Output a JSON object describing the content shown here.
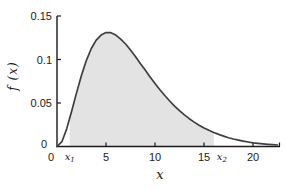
{
  "chart_data": {
    "type": "area",
    "title": "",
    "xlabel": "x",
    "ylabel": "f (x)",
    "xlim": [
      0,
      22.5
    ],
    "ylim": [
      0,
      0.15
    ],
    "x_ticks": [
      0,
      5,
      10,
      15,
      20
    ],
    "x_tick_labels": [
      "0",
      "5",
      "10",
      "15",
      "20"
    ],
    "y_ticks": [
      0,
      0.05,
      0.1,
      0.15
    ],
    "y_tick_labels": [
      "0",
      "0.05",
      "0.1",
      "0.15"
    ],
    "grid": false,
    "legend": null,
    "peak": {
      "x": 5.1,
      "f": 0.131
    },
    "shade": {
      "from": 1.3,
      "to": 16.0,
      "from_label_base": "x",
      "from_label_sub": "1",
      "to_label_base": "x",
      "to_label_sub": "2"
    },
    "colors": {
      "curve": "#3f3f3f",
      "fill": "#e3e3e3",
      "axis": "#1a1a1a",
      "text": "#1a1a1a"
    },
    "curve": [
      [
        0,
        0
      ],
      [
        0.5,
        0.0055
      ],
      [
        1,
        0.0206
      ],
      [
        1.5,
        0.0407
      ],
      [
        2,
        0.062
      ],
      [
        2.5,
        0.082
      ],
      [
        3,
        0.0991
      ],
      [
        3.5,
        0.1126
      ],
      [
        4,
        0.1223
      ],
      [
        4.5,
        0.1281
      ],
      [
        5,
        0.131
      ],
      [
        5.5,
        0.1308
      ],
      [
        6,
        0.128
      ],
      [
        6.5,
        0.1235
      ],
      [
        7,
        0.1178
      ],
      [
        7.5,
        0.1109
      ],
      [
        8,
        0.1034
      ],
      [
        8.5,
        0.0955
      ],
      [
        9,
        0.0878
      ],
      [
        9.5,
        0.08
      ],
      [
        10,
        0.0725
      ],
      [
        10.5,
        0.0653
      ],
      [
        11,
        0.0586
      ],
      [
        11.5,
        0.0523
      ],
      [
        12,
        0.0464
      ],
      [
        12.5,
        0.0412
      ],
      [
        13,
        0.0363
      ],
      [
        13.5,
        0.032
      ],
      [
        14,
        0.028
      ],
      [
        14.5,
        0.0245
      ],
      [
        15,
        0.0214
      ],
      [
        15.5,
        0.0186
      ],
      [
        16,
        0.0161
      ],
      [
        16.5,
        0.0139
      ],
      [
        17,
        0.0119
      ],
      [
        17.5,
        0.0101
      ],
      [
        18,
        0.0086
      ],
      [
        18.5,
        0.0073
      ],
      [
        19,
        0.0062
      ],
      [
        19.5,
        0.0052
      ],
      [
        20,
        0.0043
      ],
      [
        20.5,
        0.0036
      ],
      [
        21,
        0.003
      ],
      [
        21.5,
        0.0025
      ],
      [
        22,
        0.0021
      ],
      [
        22.5,
        0.0017
      ]
    ]
  }
}
